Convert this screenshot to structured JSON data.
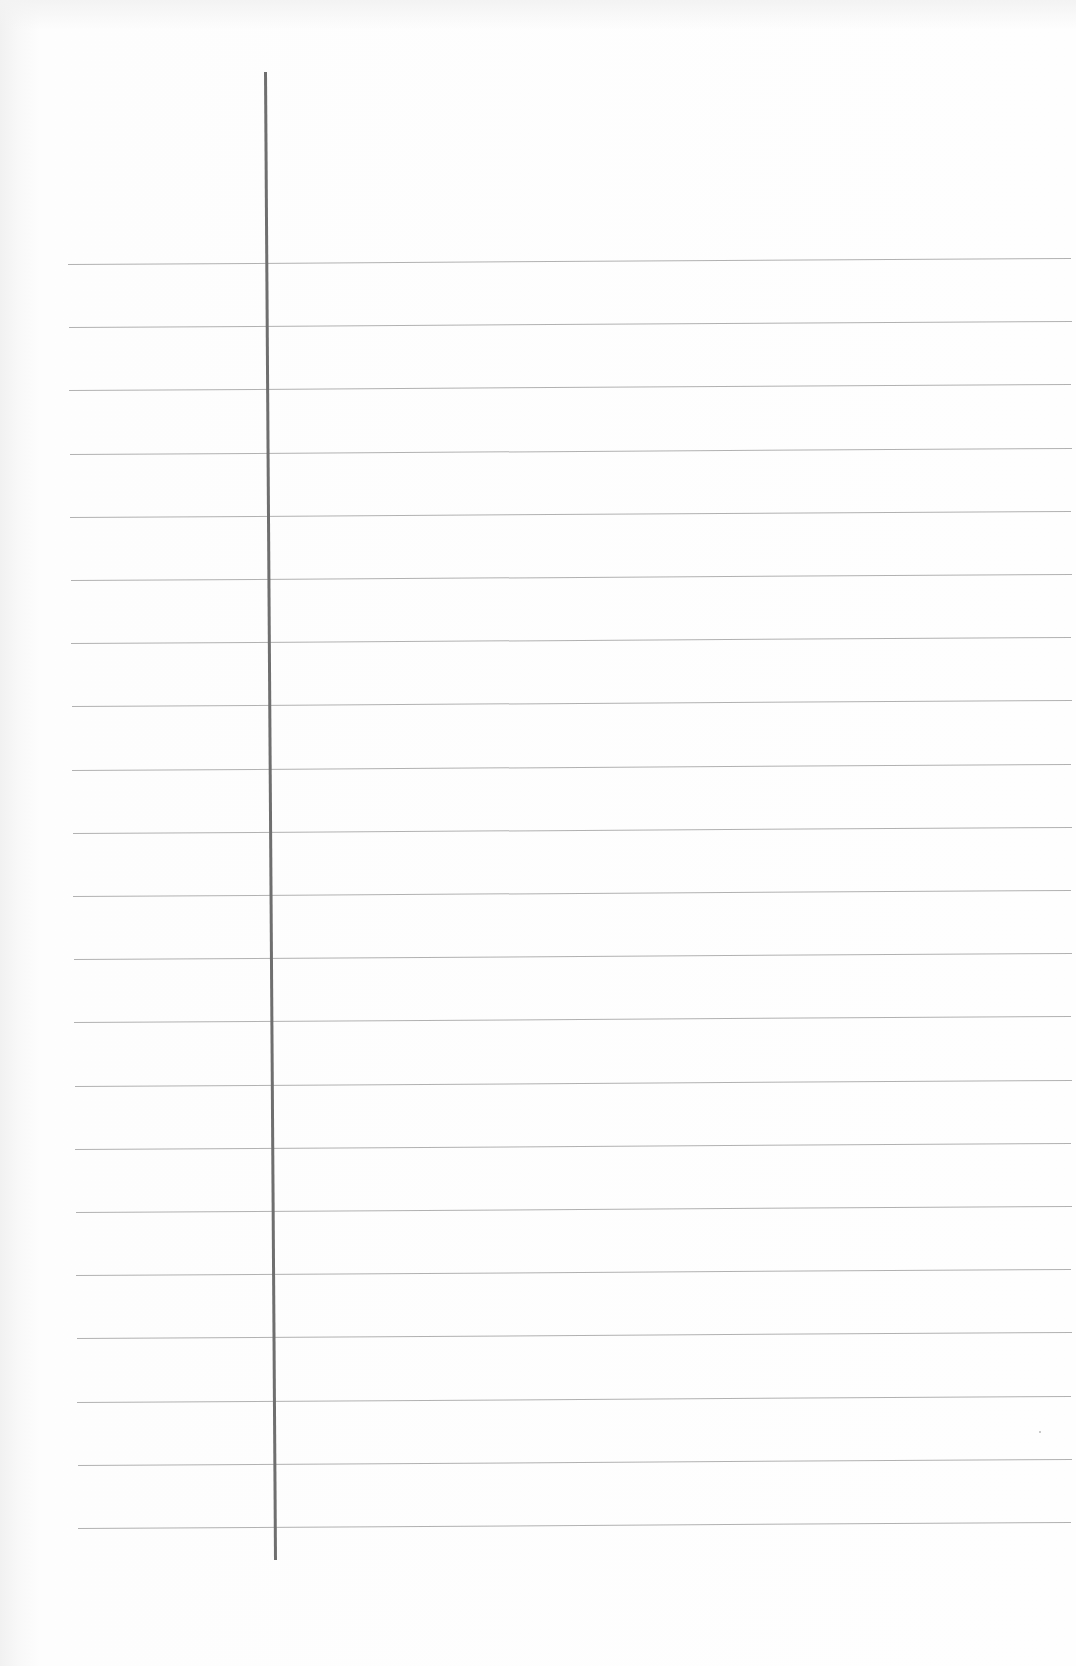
{
  "document": {
    "type": "blank ruled notebook page",
    "background_color": "#fdfdfd",
    "rule_color": "#a9a9a9",
    "margin_line_color": "#6f6f6f"
  },
  "margin_line": {
    "top": {
      "x": 264,
      "y": 72
    },
    "bottom": {
      "x": 274,
      "y": 1560
    },
    "width": 3
  },
  "rules": {
    "count": 21,
    "first_y_left": 264,
    "first_y_right": 258,
    "spacing": 63.2,
    "left_x_top": 68,
    "left_x_bottom": 78,
    "right_x": 1071
  },
  "specks": [
    {
      "x": 1039,
      "y": 1431
    }
  ]
}
